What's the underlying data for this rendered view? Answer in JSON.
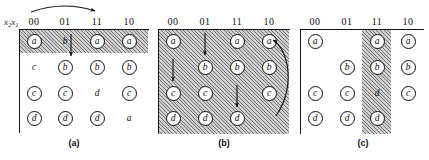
{
  "figure": {
    "axis_label": "x2x1",
    "axis_label_main": "x",
    "column_headers": [
      "00",
      "01",
      "11",
      "10"
    ],
    "row_count": 4,
    "colors": {
      "ink": "#111111",
      "hatch_fill": "#cfcfcf",
      "hatch_line": "#282828",
      "paper": "#ffffff"
    }
  },
  "panels": [
    {
      "id": "a",
      "caption": "(a)",
      "columns": [
        "00",
        "01",
        "11",
        "10"
      ],
      "shading": {
        "type": "row",
        "description": "entire first row hatched",
        "rows": [
          0
        ]
      },
      "cells": [
        [
          {
            "label": "a",
            "circled": true
          },
          {
            "label": "b",
            "circled": false
          },
          {
            "label": "a",
            "circled": true
          },
          {
            "label": "a",
            "circled": true
          }
        ],
        [
          {
            "label": "c",
            "circled": false
          },
          {
            "label": "b",
            "circled": true
          },
          {
            "label": "b",
            "circled": true
          },
          {
            "label": "b",
            "circled": true
          }
        ],
        [
          {
            "label": "c",
            "circled": true
          },
          {
            "label": "c",
            "circled": true
          },
          {
            "label": "d",
            "circled": false
          },
          {
            "label": "c",
            "circled": true
          }
        ],
        [
          {
            "label": "d",
            "circled": true
          },
          {
            "label": "d",
            "circled": true
          },
          {
            "label": "d",
            "circled": true
          },
          {
            "label": "a",
            "circled": false
          }
        ]
      ],
      "arrows": [
        {
          "name": "curved-arrow-00-to-11",
          "kind": "curve-above",
          "from": "00",
          "to": "11"
        },
        {
          "name": "down-arrow-col-01",
          "kind": "straight-down",
          "column": "01",
          "from_row": 0,
          "to_row": 1
        }
      ]
    },
    {
      "id": "b",
      "caption": "(b)",
      "columns": [
        "00",
        "01",
        "11",
        "10"
      ],
      "shading": {
        "type": "full",
        "description": "entire grid hatched"
      },
      "cells": [
        [
          {
            "label": "a",
            "circled": true
          },
          {
            "label": "",
            "circled": false
          },
          {
            "label": "a",
            "circled": true
          },
          {
            "label": "a",
            "circled": true
          }
        ],
        [
          {
            "label": "",
            "circled": false
          },
          {
            "label": "b",
            "circled": true
          },
          {
            "label": "b",
            "circled": true
          },
          {
            "label": "b",
            "circled": true
          }
        ],
        [
          {
            "label": "c",
            "circled": true
          },
          {
            "label": "c",
            "circled": true
          },
          {
            "label": "",
            "circled": false
          },
          {
            "label": "c",
            "circled": true
          }
        ],
        [
          {
            "label": "d",
            "circled": true
          },
          {
            "label": "d",
            "circled": true
          },
          {
            "label": "d",
            "circled": true
          },
          {
            "label": "",
            "circled": false
          }
        ]
      ],
      "arrows": [
        {
          "name": "down-arrow-col-01",
          "kind": "straight-down",
          "column": "01",
          "from_row": 0,
          "to_row": 1
        },
        {
          "name": "down-arrow-col-00",
          "kind": "straight-down",
          "column": "00",
          "from_row": 1,
          "to_row": 2
        },
        {
          "name": "down-arrow-col-11",
          "kind": "straight-down",
          "column": "11",
          "from_row": 2,
          "to_row": 3
        },
        {
          "name": "curved-arrow-right-side",
          "kind": "curve-right",
          "from_row": 0,
          "to_row": 3
        }
      ]
    },
    {
      "id": "c",
      "caption": "(c)",
      "columns": [
        "00",
        "01",
        "11",
        "10"
      ],
      "shading": {
        "type": "column",
        "description": "column 11 hatched, all rows",
        "columns": [
          "11"
        ]
      },
      "cells": [
        [
          {
            "label": "a",
            "circled": true
          },
          {
            "label": "",
            "circled": false
          },
          {
            "label": "a",
            "circled": true
          },
          {
            "label": "a",
            "circled": true
          }
        ],
        [
          {
            "label": "",
            "circled": false
          },
          {
            "label": "b",
            "circled": true
          },
          {
            "label": "b",
            "circled": true
          },
          {
            "label": "b",
            "circled": true
          }
        ],
        [
          {
            "label": "c",
            "circled": true
          },
          {
            "label": "c",
            "circled": true
          },
          {
            "label": "d",
            "circled": false
          },
          {
            "label": "c",
            "circled": true
          }
        ],
        [
          {
            "label": "d",
            "circled": true
          },
          {
            "label": "d",
            "circled": true
          },
          {
            "label": "d",
            "circled": true
          },
          {
            "label": "",
            "circled": false
          }
        ]
      ],
      "arrows": []
    }
  ]
}
